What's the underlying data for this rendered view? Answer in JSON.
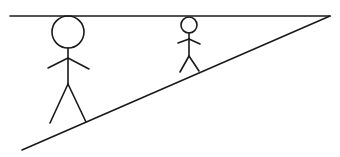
{
  "diagram": {
    "stroke_color": "#1a1a1a",
    "background": "#ffffff",
    "figures": [
      {
        "name": "large-figure",
        "head_radius": 16
      },
      {
        "name": "small-figure",
        "head_radius": 8
      }
    ]
  }
}
